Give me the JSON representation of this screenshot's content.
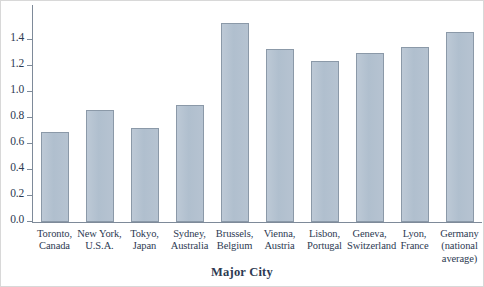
{
  "chart_data": {
    "type": "bar",
    "title": "",
    "xlabel": "Major City",
    "ylabel": "",
    "categories": [
      "Toronto, Canada",
      "New York, U.S.A.",
      "Tokyo, Japan",
      "Sydney, Australia",
      "Brussels, Belgium",
      "Vienna, Austria",
      "Lisbon, Portugal",
      "Geneva, Switzerland",
      "Lyon, France",
      "Germany (national average)"
    ],
    "category_lines": [
      [
        "Toronto,",
        "Canada"
      ],
      [
        "New York,",
        "U.S.A."
      ],
      [
        "Tokyo,",
        "Japan"
      ],
      [
        "Sydney,",
        "Australia"
      ],
      [
        "Brussels,",
        "Belgium"
      ],
      [
        "Vienna,",
        "Austria"
      ],
      [
        "Lisbon,",
        "Portugal"
      ],
      [
        "Geneva,",
        "Switzerland"
      ],
      [
        "Lyon,",
        "France"
      ],
      [
        "Germany",
        "(national",
        "average)"
      ]
    ],
    "values": [
      0.69,
      0.86,
      0.72,
      0.9,
      1.53,
      1.33,
      1.24,
      1.3,
      1.35,
      1.46
    ],
    "ylim": [
      0.0,
      1.67
    ],
    "yticks": [
      0.0,
      0.2,
      0.4,
      0.6,
      0.8,
      1.0,
      1.2,
      1.4
    ],
    "ytick_labels": [
      "0.0",
      "0.2",
      "0.4",
      "0.6",
      "0.8",
      "1.0",
      "1.2",
      "1.4"
    ],
    "grid": false,
    "legend": null,
    "bar_fill_color": "#b3c1d0",
    "bar_border_color": "#8b99a8",
    "axis_color": "#7e8a99",
    "text_color": "#2d3a52"
  }
}
